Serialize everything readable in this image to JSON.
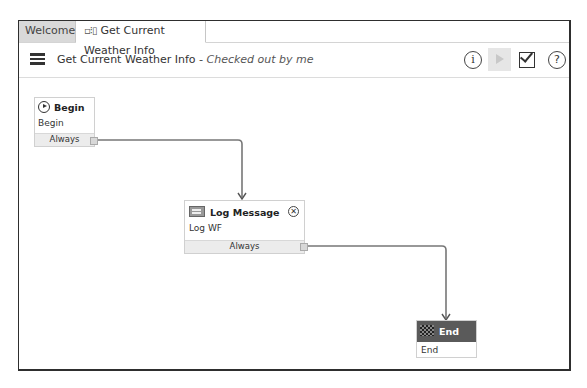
{
  "tabs": [
    {
      "label": "Welcome",
      "active": false
    },
    {
      "label": "Get Current Weather Info",
      "icon": "workflow-icon",
      "active": true
    }
  ],
  "toolbar": {
    "title": "Get Current Weather Info",
    "status": " - Checked out by me",
    "icons": [
      "menu-icon",
      "info-icon",
      "run-icon",
      "validate-icon",
      "help-icon"
    ],
    "info_glyph": "i",
    "help_glyph": "?"
  },
  "nodes": [
    {
      "id": "begin",
      "title": "Begin",
      "subtitle": "Begin",
      "footer": "Always",
      "icon": "play-circle-icon"
    },
    {
      "id": "log",
      "title": "Log Message",
      "subtitle": "Log WF",
      "footer": "Always",
      "icon": "log-icon",
      "close_glyph": "✕"
    },
    {
      "id": "end",
      "title": "End",
      "subtitle": "End",
      "icon": "checkered-flag-icon",
      "header_color": "#5a5a5a"
    }
  ],
  "connections": [
    {
      "from": "begin",
      "to": "log",
      "label": "Always"
    },
    {
      "from": "log",
      "to": "end",
      "label": "Always"
    }
  ]
}
